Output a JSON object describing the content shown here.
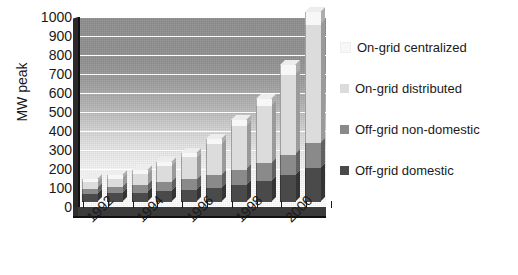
{
  "chart_data": {
    "type": "bar",
    "subtype": "stacked-column-3d",
    "title": "",
    "subtitle": "",
    "xlabel": "",
    "ylabel": "MW peak",
    "ylim": [
      0,
      1000
    ],
    "ytick_step": 100,
    "yticks": [
      1000,
      900,
      800,
      700,
      600,
      500,
      400,
      300,
      200,
      100,
      0
    ],
    "ytick_labels": [
      "1000",
      "900",
      "800",
      "700",
      "600",
      "500",
      "400",
      "300",
      "200",
      "100",
      "0"
    ],
    "grid": true,
    "grid_axis": "y",
    "grid_color": "#ffffff",
    "legend_position": "right",
    "categories": [
      "1992",
      "1993",
      "1994",
      "1995",
      "1996",
      "1997",
      "1998",
      "1999",
      "2000",
      "2001"
    ],
    "xtick_labels_shown": [
      "1992",
      "1994",
      "1996",
      "1998",
      "2000"
    ],
    "xtick_label_rotation": -45,
    "series": [
      {
        "name": "Off-grid domestic",
        "color": "#4a4a4a",
        "values": [
          40,
          45,
          50,
          58,
          65,
          75,
          90,
          110,
          140,
          180
        ]
      },
      {
        "name": "Off-grid non-domestic",
        "color": "#8a8a8a",
        "values": [
          30,
          33,
          38,
          45,
          55,
          65,
          80,
          95,
          110,
          130
        ]
      },
      {
        "name": "On-grid distributed",
        "color": "#dcdcdc",
        "values": [
          35,
          45,
          60,
          85,
          115,
          165,
          230,
          300,
          420,
          620
        ]
      },
      {
        "name": "On-grid centralized",
        "color": "#f7f7f7",
        "values": [
          15,
          17,
          20,
          22,
          25,
          27,
          30,
          35,
          50,
          70
        ]
      }
    ],
    "totals": [
      120,
      140,
      168,
      210,
      260,
      332,
      430,
      540,
      720,
      1000
    ]
  },
  "axis": {
    "y_title": "MW peak"
  },
  "legend": {
    "items": [
      {
        "label": "On-grid centralized",
        "color": "#f7f7f7"
      },
      {
        "label": "On-grid distributed",
        "color": "#dcdcdc"
      },
      {
        "label": "Off-grid non-domestic",
        "color": "#8a8a8a"
      },
      {
        "label": "Off-grid domestic",
        "color": "#4a4a4a"
      }
    ]
  }
}
